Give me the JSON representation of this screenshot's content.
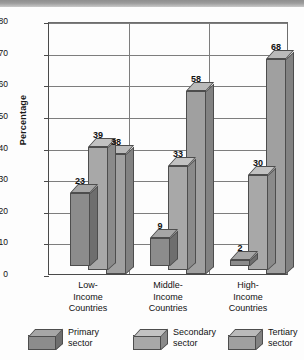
{
  "chart_data": {
    "type": "bar",
    "title": "",
    "xlabel": "",
    "ylabel": "Percentage",
    "ylim": [
      0,
      80
    ],
    "yticks": [
      0,
      10,
      20,
      30,
      40,
      50,
      60,
      70,
      80
    ],
    "grid": true,
    "legend_position": "bottom",
    "categories": [
      "Low-Income Countries",
      "Middle-Income Countries",
      "High-Income Countries"
    ],
    "category_lines": [
      [
        "Low-",
        "Income",
        "Countries"
      ],
      [
        "Middle-",
        "Income",
        "Countries"
      ],
      [
        "High-",
        "Income",
        "Countries"
      ]
    ],
    "series": [
      {
        "name": "Primary sector",
        "values": [
          23,
          9,
          2
        ],
        "color": "#8c8c8c"
      },
      {
        "name": "Secondary sector",
        "values": [
          39,
          33,
          30
        ],
        "color": "#a8a8a8"
      },
      {
        "name": "Tertiary sector",
        "values": [
          38,
          58,
          68
        ],
        "color": "#a0a0a0"
      }
    ]
  },
  "axis": {
    "ylabel": "Percentage",
    "ytick_labels": [
      "80",
      "70",
      "60",
      "50",
      "40",
      "30",
      "20",
      "10",
      "0"
    ]
  },
  "legend": {
    "items": [
      {
        "line1": "Primary",
        "line2": "sector",
        "icon": "cube-icon",
        "color": "#8c8c8c"
      },
      {
        "line1": "Secondary",
        "line2": "sector",
        "icon": "cube-icon",
        "color": "#a8a8a8"
      },
      {
        "line1": "Tertiary",
        "line2": "sector",
        "icon": "cube-icon",
        "color": "#a0a0a0"
      }
    ]
  },
  "value_labels": {
    "g1": [
      "23",
      "39",
      "38"
    ],
    "g2": [
      "9",
      "33",
      "58"
    ],
    "g3": [
      "2",
      "30",
      "68"
    ]
  }
}
